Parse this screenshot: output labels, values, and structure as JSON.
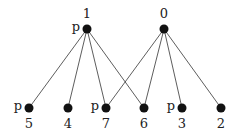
{
  "diagram": {
    "type": "bipartite-graph",
    "top_nodes": [
      {
        "id": "1",
        "label": "1",
        "x": 87,
        "y": 29,
        "marked": true,
        "mark": "p"
      },
      {
        "id": "0",
        "label": "0",
        "x": 164,
        "y": 29,
        "marked": false,
        "mark": ""
      }
    ],
    "bottom_nodes": [
      {
        "id": "5",
        "label": "5",
        "x": 29,
        "y": 108,
        "marked": true,
        "mark": "p"
      },
      {
        "id": "4",
        "label": "4",
        "x": 68,
        "y": 108,
        "marked": false,
        "mark": ""
      },
      {
        "id": "7",
        "label": "7",
        "x": 106,
        "y": 108,
        "marked": true,
        "mark": "p"
      },
      {
        "id": "6",
        "label": "6",
        "x": 144,
        "y": 108,
        "marked": false,
        "mark": ""
      },
      {
        "id": "3",
        "label": "3",
        "x": 182,
        "y": 108,
        "marked": true,
        "mark": "p"
      },
      {
        "id": "2",
        "label": "2",
        "x": 221,
        "y": 108,
        "marked": false,
        "mark": ""
      }
    ],
    "edges": [
      [
        "1",
        "5"
      ],
      [
        "1",
        "4"
      ],
      [
        "1",
        "7"
      ],
      [
        "1",
        "6"
      ],
      [
        "0",
        "7"
      ],
      [
        "0",
        "6"
      ],
      [
        "0",
        "3"
      ],
      [
        "0",
        "2"
      ]
    ],
    "colors": {
      "node": "#111111",
      "edge": "#333333",
      "text": "#222222"
    }
  }
}
